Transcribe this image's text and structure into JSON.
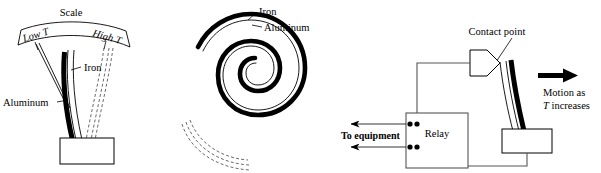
{
  "figure": {
    "background_color": "#ffffff",
    "ink_color": "#000000",
    "wire_color": "#555555"
  },
  "panel_left": {
    "name": "bimetallic-strip-with-scale",
    "scale_label": "Scale",
    "low_temp_label": "Low T",
    "high_temp_label": "High T",
    "iron_label": "Iron",
    "aluminum_label": "Aluminum",
    "base_block_label": "",
    "deflected_outline_style": "dashed"
  },
  "panel_middle": {
    "name": "bimetallic-spiral",
    "iron_label": "Iron",
    "aluminum_label": "Aluminum",
    "turns": 2.5,
    "unwound_outline_style": "dashed"
  },
  "panel_right": {
    "name": "thermostat-relay-circuit",
    "contact_point_label": "Contact point",
    "relay_label": "Relay",
    "to_equipment_label": "To equipment",
    "motion_label_line1": "Motion as",
    "motion_label_italic": "T",
    "motion_label_line2": " increases",
    "relay_terminal_count": 4,
    "output_arrow_count": 2
  }
}
